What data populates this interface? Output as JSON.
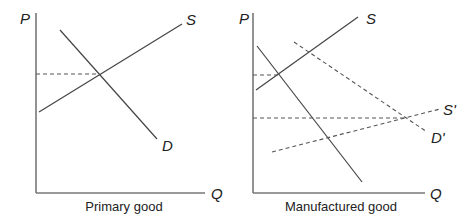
{
  "panels": [
    {
      "caption": "Primary good",
      "y_axis_label": "P",
      "x_axis_label": "Q",
      "curves": {
        "supply": "S",
        "demand": "D"
      }
    },
    {
      "caption": "Manufactured good",
      "y_axis_label": "P",
      "x_axis_label": "Q",
      "curves": {
        "supply": "S",
        "demand": "D",
        "supply_shifted": "S'",
        "demand_shifted": "D'"
      }
    }
  ],
  "colors": {
    "line": "#444444",
    "axis": "#666666",
    "text": "#222222"
  }
}
